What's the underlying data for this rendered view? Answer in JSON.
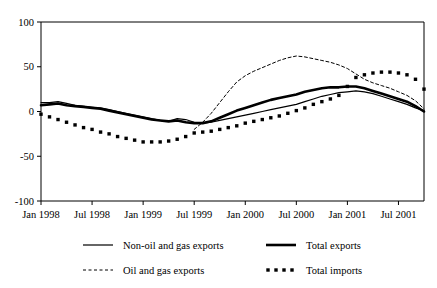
{
  "figure": {
    "title": "",
    "background_color": "#ffffff",
    "line_color": "#000000"
  },
  "chart_data": {
    "type": "line",
    "title": "",
    "subtitle": "",
    "xlabel": "",
    "ylabel": "",
    "ylim": [
      -100,
      100
    ],
    "yticks": [
      -100,
      -50,
      0,
      50,
      100
    ],
    "ytick_labels": [
      "-100",
      "-50",
      "0",
      "50",
      "100"
    ],
    "xtick_labels": [
      "Jan 1998",
      "Jul 1998",
      "Jan 1999",
      "Jul 1999",
      "Jan 2000",
      "Jul 2000",
      "Jan 2001",
      "Jul 2001"
    ],
    "xtick_indices": [
      0,
      6,
      12,
      18,
      24,
      30,
      36,
      42
    ],
    "grid": false,
    "legend_position": "bottom",
    "x": [
      "Jan 1998",
      "Feb 1998",
      "Mar 1998",
      "Apr 1998",
      "May 1998",
      "Jun 1998",
      "Jul 1998",
      "Aug 1998",
      "Sep 1998",
      "Oct 1998",
      "Nov 1998",
      "Dec 1998",
      "Jan 1999",
      "Feb 1999",
      "Mar 1999",
      "Apr 1999",
      "May 1999",
      "Jun 1999",
      "Jul 1999",
      "Aug 1999",
      "Sep 1999",
      "Oct 1999",
      "Nov 1999",
      "Dec 1999",
      "Jan 2000",
      "Feb 2000",
      "Mar 2000",
      "Apr 2000",
      "May 2000",
      "Jun 2000",
      "Jul 2000",
      "Aug 2000",
      "Sep 2000",
      "Oct 2000",
      "Nov 2000",
      "Dec 2000",
      "Jan 2001",
      "Feb 2001",
      "Mar 2001",
      "Apr 2001",
      "May 2001",
      "Jun 2001",
      "Jul 2001",
      "Aug 2001",
      "Sep 2001",
      "Oct 2001"
    ],
    "series": [
      {
        "name": "Non-oil and gas exports",
        "style": "thin-solid",
        "values": [
          10,
          10,
          11,
          9,
          7,
          6,
          5,
          4,
          2,
          0,
          -2,
          -4,
          -6,
          -8,
          -10,
          -11,
          -8,
          -9,
          -12,
          -13,
          -12,
          -10,
          -8,
          -6,
          -4,
          -2,
          0,
          2,
          4,
          6,
          8,
          11,
          14,
          17,
          19,
          21,
          22,
          23,
          22,
          20,
          17,
          14,
          11,
          8,
          4,
          1
        ]
      },
      {
        "name": "Total exports",
        "style": "thick-solid",
        "values": [
          7,
          8,
          9,
          7,
          6,
          5,
          4,
          3,
          1,
          -1,
          -3,
          -5,
          -7,
          -9,
          -10,
          -11,
          -10,
          -12,
          -13,
          -13,
          -11,
          -7,
          -3,
          1,
          4,
          7,
          10,
          13,
          15,
          17,
          19,
          22,
          24,
          26,
          27,
          27,
          28,
          28,
          26,
          23,
          20,
          17,
          14,
          11,
          6,
          0
        ]
      },
      {
        "name": "Oil and gas exports",
        "style": "dashed",
        "values": [
          null,
          null,
          null,
          null,
          null,
          null,
          null,
          null,
          null,
          null,
          null,
          null,
          null,
          null,
          null,
          null,
          null,
          null,
          -20,
          -12,
          -2,
          10,
          22,
          33,
          40,
          45,
          49,
          53,
          57,
          60,
          62,
          61,
          59,
          57,
          55,
          52,
          48,
          42,
          36,
          32,
          29,
          26,
          22,
          18,
          12,
          3
        ]
      },
      {
        "name": "Total imports",
        "style": "dotted",
        "values": [
          -3,
          -6,
          -9,
          -12,
          -15,
          -18,
          -20,
          -23,
          -25,
          -28,
          -30,
          -32,
          -34,
          -34,
          -34,
          -33,
          -31,
          -28,
          -24,
          -23,
          -22,
          -20,
          -18,
          -16,
          -13,
          -11,
          -9,
          -7,
          -5,
          -2,
          1,
          4,
          8,
          11,
          14,
          18,
          28,
          38,
          41,
          43,
          44,
          44,
          43,
          41,
          36,
          25
        ]
      }
    ]
  },
  "legend": {
    "entries": [
      {
        "label": "Non-oil and gas exports",
        "style": "thin-solid"
      },
      {
        "label": "Total exports",
        "style": "thick-solid"
      },
      {
        "label": "Oil and gas exports",
        "style": "dashed"
      },
      {
        "label": "Total imports",
        "style": "dotted"
      }
    ]
  }
}
